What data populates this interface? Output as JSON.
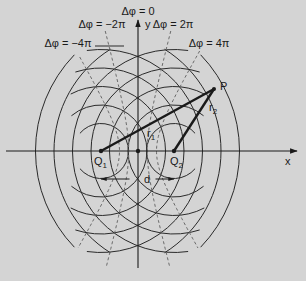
{
  "colors": {
    "background": "#d4d4d4",
    "line": "#2a2a2a",
    "dashed": "#6a6a6a",
    "thick": "#1a1a1a"
  },
  "geometry": {
    "center": [
      138,
      151
    ],
    "q1": [
      101,
      151
    ],
    "q2": [
      174,
      151
    ],
    "p": [
      214,
      89
    ],
    "wavelength": 18.5,
    "radii": [
      27.5,
      46,
      64.5,
      83,
      101.5,
      120,
      138.5
    ],
    "arc_half_angles_deg": [
      140,
      130,
      118,
      108,
      98,
      58,
      44
    ],
    "x_axis": {
      "from": [
        6,
        151
      ],
      "to": [
        297,
        151
      ]
    },
    "y_axis": {
      "from": [
        138,
        268
      ],
      "to": [
        138,
        20
      ]
    },
    "d_line": {
      "y": 179,
      "from": 101,
      "to": 174
    },
    "hyperbolas": [
      {
        "label_key": "minus4pi",
        "m": -2,
        "top": [
          70,
          57
        ],
        "bottom": [
          72,
          248
        ]
      },
      {
        "label_key": "minus2pi",
        "m": -1,
        "top": [
          106,
          31
        ],
        "bottom": [
          105,
          268
        ]
      },
      {
        "label_key": "plus2pi",
        "m": 1,
        "top": [
          170,
          31
        ],
        "bottom": [
          171,
          268
        ]
      },
      {
        "label_key": "plus4pi",
        "m": 2,
        "top": [
          205,
          51
        ],
        "bottom": [
          203,
          248
        ]
      }
    ]
  },
  "labels": {
    "dphi0": "Δφ = 0",
    "minus2pi": "Δφ = −2π",
    "plus2pi": "Δφ = 2π",
    "minus4pi": "Δφ = −4π",
    "plus4pi": "Δφ = 4π",
    "y_axis": "y",
    "x_axis": "x",
    "p": "P",
    "q1": "Q",
    "q1_sub": "1",
    "q2": "Q",
    "q2_sub": "2",
    "r1": "r",
    "r1_sub": "1",
    "r2": "r",
    "r2_sub": "2",
    "d": "d"
  }
}
